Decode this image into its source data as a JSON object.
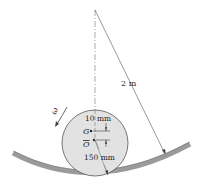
{
  "diagram": {
    "labels": {
      "length": "2 m",
      "offset": "10 mm",
      "radius": "150 mm",
      "center_of_mass": "G",
      "geometric_center": "O",
      "angular_velocity": "ω"
    },
    "colors": {
      "disk_fill": "#e2e2e2",
      "track": "#9a9a9a",
      "lines": "#444444"
    }
  }
}
